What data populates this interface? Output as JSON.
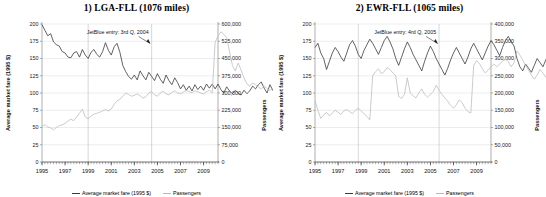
{
  "chart_data": [
    {
      "type": "line",
      "title": "1) LGA-FLL (1076 miles)",
      "xlabel": "",
      "ylabel": "Average market fare (1995 $)",
      "y2label": "Passengers",
      "xlim": [
        1995,
        2010.25
      ],
      "ylim": [
        0,
        200
      ],
      "y2lim": [
        0,
        600000
      ],
      "yticks": [
        0,
        25,
        50,
        75,
        100,
        125,
        150,
        175,
        200
      ],
      "ytick_labels": [
        "0",
        "25",
        "50",
        "75",
        "100",
        "125",
        "150",
        "175",
        "200"
      ],
      "y2ticks": [
        0,
        75000,
        150000,
        225000,
        300000,
        375000,
        450000,
        525000,
        600000
      ],
      "y2tick_labels": [
        "0",
        "75,000",
        "150,000",
        "225,000",
        "300,000",
        "375,000",
        "450,000",
        "525,000",
        "600,000"
      ],
      "xticks": [
        1995,
        1997,
        1999,
        2001,
        2003,
        2005,
        2007,
        2009
      ],
      "xtick_labels": [
        "1995",
        "1997",
        "1999",
        "2001",
        "2003",
        "2005",
        "2007",
        "2009"
      ],
      "grid": true,
      "legend": [
        "Average market fare (1995 $)",
        "Passengers"
      ],
      "legend_position": "bottom",
      "annotation": "JetBlue entry: 3rd Q, 2004",
      "annotation_x": 2004.5,
      "vlines": [
        1999.0,
        2004.5
      ],
      "colors": {
        "fare": "#3b3b3b",
        "passengers": "#b9b9b9",
        "grid": "#d9d9d9",
        "axis": "#7a7a7a"
      },
      "series": [
        {
          "name": "Average market fare (1995 $)",
          "axis": "left",
          "x_start": 1995.0,
          "x_step": 0.25,
          "values": [
            199,
            191,
            183,
            186,
            174,
            170,
            168,
            160,
            158,
            152,
            151,
            158,
            160,
            152,
            163,
            155,
            150,
            159,
            163,
            156,
            152,
            160,
            173,
            162,
            155,
            167,
            172,
            159,
            140,
            131,
            124,
            120,
            126,
            119,
            132,
            125,
            119,
            130,
            124,
            118,
            128,
            120,
            114,
            126,
            118,
            112,
            122,
            115,
            106,
            112,
            104,
            110,
            103,
            112,
            105,
            110,
            104,
            113,
            107,
            113,
            106,
            113,
            105,
            100,
            109,
            103,
            99,
            104,
            100,
            97,
            104,
            99,
            103,
            110,
            106,
            112,
            116,
            107,
            100,
            112,
            104,
            98,
            106,
            99,
            104,
            112,
            106,
            116,
            110,
            106,
            112
          ]
        },
        {
          "name": "Passengers",
          "axis": "right",
          "x_start": 1995.0,
          "x_step": 0.25,
          "values": [
            156000,
            162000,
            152000,
            148000,
            140000,
            150000,
            158000,
            162000,
            168000,
            178000,
            186000,
            180000,
            196000,
            212000,
            230000,
            196000,
            188000,
            200000,
            208000,
            212000,
            216000,
            222000,
            228000,
            222000,
            230000,
            250000,
            266000,
            272000,
            286000,
            300000,
            294000,
            286000,
            290000,
            296000,
            288000,
            278000,
            284000,
            300000,
            306000,
            292000,
            286000,
            300000,
            308000,
            296000,
            292000,
            302000,
            310000,
            300000,
            296000,
            304000,
            312000,
            306000,
            302000,
            310000,
            306000,
            300000,
            296000,
            306000,
            312000,
            300000,
            520000,
            548000,
            566000,
            556000,
            540000,
            480000,
            420000,
            396000,
            430000,
            400000,
            366000,
            340000,
            330000,
            344000,
            336000,
            326000,
            318000,
            330000,
            320000,
            312000,
            318000,
            328000,
            320000,
            310000,
            300000,
            312000,
            306000,
            296000,
            288000,
            310000,
            330000
          ]
        }
      ]
    },
    {
      "type": "line",
      "title": "2) EWR-FLL (1065 miles)",
      "xlabel": "",
      "ylabel": "Average market fare (1995 $)",
      "y2label": "Passengers",
      "xlim": [
        1995,
        2010.25
      ],
      "ylim": [
        0,
        200
      ],
      "y2lim": [
        0,
        400000
      ],
      "yticks": [
        0,
        25,
        50,
        75,
        100,
        125,
        150,
        175,
        200
      ],
      "ytick_labels": [
        "0",
        "25",
        "50",
        "75",
        "100",
        "125",
        "150",
        "175",
        "200"
      ],
      "y2ticks": [
        0,
        50000,
        100000,
        150000,
        200000,
        250000,
        300000,
        350000,
        400000
      ],
      "y2tick_labels": [
        "0",
        "50,000",
        "100,000",
        "150,000",
        "200,000",
        "250,000",
        "300,000",
        "350,000",
        "400,000"
      ],
      "xticks": [
        1995,
        1997,
        1999,
        2001,
        2003,
        2005,
        2007,
        2009
      ],
      "xtick_labels": [
        "1995",
        "1997",
        "1999",
        "2001",
        "2003",
        "2005",
        "2007",
        "2009"
      ],
      "grid": true,
      "legend": [
        "Average market fare (1995 $)",
        "Passengers"
      ],
      "legend_position": "bottom",
      "annotation": "JetBlue entry: 4rd Q, 2005",
      "annotation_x": 2005.75,
      "vlines": [
        1998.75,
        2005.75
      ],
      "colors": {
        "fare": "#3b3b3b",
        "passengers": "#b9b9b9",
        "grid": "#d9d9d9",
        "axis": "#7a7a7a"
      },
      "series": [
        {
          "name": "Average market fare (1995 $)",
          "axis": "left",
          "x_start": 1995.0,
          "x_step": 0.25,
          "values": [
            166,
            172,
            158,
            150,
            134,
            146,
            158,
            166,
            160,
            152,
            146,
            158,
            170,
            176,
            168,
            156,
            150,
            162,
            170,
            178,
            172,
            164,
            156,
            166,
            176,
            182,
            174,
            164,
            150,
            140,
            152,
            164,
            174,
            166,
            156,
            148,
            140,
            132,
            146,
            158,
            168,
            160,
            150,
            142,
            134,
            126,
            136,
            148,
            158,
            166,
            158,
            150,
            142,
            152,
            164,
            172,
            164,
            156,
            148,
            158,
            168,
            176,
            170,
            162,
            154,
            166,
            176,
            182,
            174,
            168,
            150,
            138,
            132,
            142,
            136,
            130,
            140,
            150,
            144,
            138,
            148,
            158,
            152,
            146,
            156,
            162,
            154,
            148,
            140,
            150,
            162
          ]
        },
        {
          "name": "Passengers",
          "axis": "right",
          "x_start": 1995.0,
          "x_step": 0.25,
          "values": [
            178000,
            150000,
            126000,
            136000,
            144000,
            134000,
            142000,
            150000,
            144000,
            138000,
            148000,
            152000,
            146000,
            140000,
            150000,
            156000,
            148000,
            140000,
            132000,
            122000,
            250000,
            262000,
            270000,
            256000,
            262000,
            274000,
            268000,
            258000,
            250000,
            190000,
            184000,
            196000,
            244000,
            200000,
            192000,
            186000,
            200000,
            212000,
            196000,
            188000,
            196000,
            204000,
            222000,
            208000,
            196000,
            186000,
            176000,
            164000,
            156000,
            166000,
            180000,
            172000,
            156000,
            146000,
            142000,
            280000,
            294000,
            286000,
            270000,
            258000,
            266000,
            276000,
            284000,
            276000,
            284000,
            292000,
            300000,
            290000,
            276000,
            288000,
            322000,
            310000,
            296000,
            280000,
            266000,
            252000,
            240000,
            252000,
            268000,
            258000,
            246000,
            236000,
            244000,
            258000,
            272000,
            264000,
            252000,
            238000,
            226000,
            260000,
            310000
          ]
        }
      ]
    }
  ]
}
